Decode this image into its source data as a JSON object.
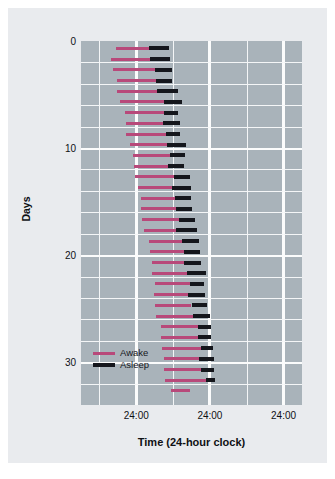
{
  "chart_data": {
    "type": "bar",
    "title": "",
    "subtitle": "",
    "xlabel": "Time (24-hour clock)",
    "ylabel": "Days",
    "grid": true,
    "legend_position": "inside-lower-left",
    "xtick_labels": [
      "24:00",
      "24:00",
      "24:00"
    ],
    "xtick_positions_hours": [
      24,
      48,
      72
    ],
    "xlim_hours": [
      6,
      78
    ],
    "ytick_labels": [
      "0",
      "10",
      "20",
      "30"
    ],
    "ytick_values": [
      0,
      10,
      20,
      30
    ],
    "ylim": [
      0,
      34
    ],
    "series": [
      {
        "name": "Awake",
        "color": "#b8497a"
      },
      {
        "name": "Asleep",
        "color": "#14161c"
      }
    ],
    "records": [
      {
        "day": 0,
        "awake_start": 17.5,
        "awake_end": 28.0,
        "asleep_start": 28.0,
        "asleep_end": 34.6
      },
      {
        "day": 1,
        "awake_start": 15.8,
        "awake_end": 28.6,
        "asleep_start": 28.6,
        "asleep_end": 35.1
      },
      {
        "day": 2,
        "awake_start": 16.4,
        "awake_end": 30.0,
        "asleep_start": 30.0,
        "asleep_end": 35.6
      },
      {
        "day": 3,
        "awake_start": 17.6,
        "awake_end": 30.4,
        "asleep_start": 30.4,
        "asleep_end": 35.6
      },
      {
        "day": 4,
        "awake_start": 17.6,
        "awake_end": 30.8,
        "asleep_start": 30.8,
        "asleep_end": 37.5
      },
      {
        "day": 5,
        "awake_start": 18.6,
        "awake_end": 33.2,
        "asleep_start": 33.2,
        "asleep_end": 38.9
      },
      {
        "day": 6,
        "awake_start": 20.4,
        "awake_end": 33.0,
        "asleep_start": 33.0,
        "asleep_end": 37.6
      },
      {
        "day": 7,
        "awake_start": 20.6,
        "awake_end": 32.6,
        "asleep_start": 32.6,
        "asleep_end": 38.2
      },
      {
        "day": 8,
        "awake_start": 20.6,
        "awake_end": 33.8,
        "asleep_start": 33.8,
        "asleep_end": 38.4
      },
      {
        "day": 9,
        "awake_start": 22.0,
        "awake_end": 34.0,
        "asleep_start": 34.0,
        "asleep_end": 40.1
      },
      {
        "day": 10,
        "awake_start": 23.0,
        "awake_end": 35.0,
        "asleep_start": 35.0,
        "asleep_end": 39.9
      },
      {
        "day": 11,
        "awake_start": 23.2,
        "awake_end": 34.2,
        "asleep_start": 34.2,
        "asleep_end": 39.7
      },
      {
        "day": 12,
        "awake_start": 23.6,
        "awake_end": 36.2,
        "asleep_start": 36.2,
        "asleep_end": 41.4
      },
      {
        "day": 13,
        "awake_start": 24.6,
        "awake_end": 35.6,
        "asleep_start": 35.6,
        "asleep_end": 41.8
      },
      {
        "day": 14,
        "awake_start": 25.6,
        "awake_end": 36.6,
        "asleep_start": 36.6,
        "asleep_end": 42.0
      },
      {
        "day": 15,
        "awake_start": 25.4,
        "awake_end": 36.8,
        "asleep_start": 36.8,
        "asleep_end": 42.2
      },
      {
        "day": 16,
        "awake_start": 26.0,
        "awake_end": 37.8,
        "asleep_start": 37.8,
        "asleep_end": 43.2
      },
      {
        "day": 17,
        "awake_start": 26.6,
        "awake_end": 37.0,
        "asleep_start": 37.0,
        "asleep_end": 43.8
      },
      {
        "day": 18,
        "awake_start": 28.2,
        "awake_end": 39.0,
        "asleep_start": 39.0,
        "asleep_end": 44.4
      },
      {
        "day": 19,
        "awake_start": 28.6,
        "awake_end": 39.6,
        "asleep_start": 39.6,
        "asleep_end": 44.8
      },
      {
        "day": 20,
        "awake_start": 29.2,
        "awake_end": 39.4,
        "asleep_start": 39.4,
        "asleep_end": 45.2
      },
      {
        "day": 21,
        "awake_start": 29.2,
        "awake_end": 40.6,
        "asleep_start": 40.6,
        "asleep_end": 46.6
      },
      {
        "day": 22,
        "awake_start": 30.0,
        "awake_end": 41.4,
        "asleep_start": 41.4,
        "asleep_end": 46.2
      },
      {
        "day": 23,
        "awake_start": 29.8,
        "awake_end": 41.0,
        "asleep_start": 41.0,
        "asleep_end": 46.4
      },
      {
        "day": 24,
        "awake_start": 30.0,
        "awake_end": 42.0,
        "asleep_start": 42.0,
        "asleep_end": 47.0
      },
      {
        "day": 25,
        "awake_start": 30.4,
        "awake_end": 42.4,
        "asleep_start": 42.4,
        "asleep_end": 48.0
      },
      {
        "day": 26,
        "awake_start": 32.0,
        "awake_end": 44.0,
        "asleep_start": 44.0,
        "asleep_end": 48.4
      },
      {
        "day": 27,
        "awake_start": 32.2,
        "awake_end": 44.0,
        "asleep_start": 44.0,
        "asleep_end": 48.4
      },
      {
        "day": 28,
        "awake_start": 32.4,
        "awake_end": 45.2,
        "asleep_start": 45.2,
        "asleep_end": 49.0
      },
      {
        "day": 29,
        "awake_start": 33.0,
        "awake_end": 44.6,
        "asleep_start": 44.6,
        "asleep_end": 49.2
      },
      {
        "day": 30,
        "awake_start": 33.2,
        "awake_end": 45.0,
        "asleep_start": 45.0,
        "asleep_end": 49.4
      },
      {
        "day": 31,
        "awake_start": 33.4,
        "awake_end": 46.6,
        "asleep_start": 46.6,
        "asleep_end": 49.6
      },
      {
        "day": 32,
        "awake_start": 35.2,
        "awake_end": 41.6,
        "asleep_start": null,
        "asleep_end": null
      }
    ]
  },
  "legend": {
    "awake_label": "Awake",
    "asleep_label": "Asleep"
  },
  "axes": {
    "x_title": "Time (24-hour clock)",
    "y_title": "Days"
  },
  "colors": {
    "awake": "#b8497a",
    "asleep": "#14161c",
    "plot_background": "#a9b3ba",
    "panel_background": "#e9ebee",
    "gridline": "#f4f6f7"
  }
}
